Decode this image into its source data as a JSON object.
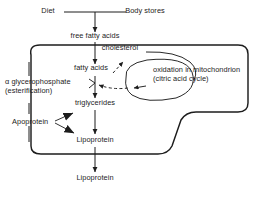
{
  "diagram": {
    "type": "flow-diagram",
    "colors": {
      "stroke": "#1d1d1d",
      "text": "#1d1d1d",
      "background": "#ffffff"
    },
    "labels": {
      "diet": "Diet",
      "body_stores": "Body stores",
      "free_fatty_acids": "free fatty acids",
      "cholesterol": "cholesterol",
      "fatty_acids": "fatty acids",
      "oxidation_line1": "oxidation in mitochondrion",
      "oxidation_line2": "(citric acid cycle)",
      "glycerophosphate_line1": "α glycerophosphate",
      "glycerophosphate_line2": "(esterification)",
      "triglycerides": "triglycerides",
      "apoprotein": "Apoprotein",
      "lipoprotein_inner": "Lipoprotein",
      "lipoprotein_outer": "Lipoprotein"
    },
    "nodes": [
      {
        "id": "diet",
        "label": "Diet",
        "x": 48,
        "y": 8
      },
      {
        "id": "body-stores",
        "label": "Body stores",
        "x": 118,
        "y": 8
      },
      {
        "id": "free-fatty-acids",
        "label": "free fatty acids",
        "x": 97,
        "y": 38
      },
      {
        "id": "cholesterol",
        "label": "cholesterol",
        "x": 114,
        "y": 50
      },
      {
        "id": "fatty-acids",
        "label": "fatty acids",
        "x": 79,
        "y": 70
      },
      {
        "id": "oxidation-mitochondrion",
        "label": "oxidation in mitochondrion (citric acid cycle)",
        "x": 155,
        "y": 73
      },
      {
        "id": "alpha-glycerophosphate",
        "label": "α glycerophosphate (esterification)",
        "x": 7,
        "y": 85
      },
      {
        "id": "triglycerides",
        "label": "triglycerides",
        "x": 75,
        "y": 103
      },
      {
        "id": "apoprotein",
        "label": "Apoprotein",
        "x": 15,
        "y": 119
      },
      {
        "id": "lipoprotein-inner",
        "label": "Lipoprotein",
        "x": 78,
        "y": 140
      },
      {
        "id": "lipoprotein-outer",
        "label": "Lipoprotein",
        "x": 78,
        "y": 178
      }
    ],
    "edges": [
      {
        "from": "diet",
        "to": "free-fatty-acids",
        "style": "solid",
        "arrow": "single"
      },
      {
        "from": "body-stores",
        "to": "free-fatty-acids",
        "style": "solid",
        "arrow": "single"
      },
      {
        "from": "free-fatty-acids",
        "to": "fatty-acids",
        "style": "solid",
        "arrow": "single"
      },
      {
        "from": "fatty-acids",
        "to": "oxidation-mitochondrion",
        "style": "dashed",
        "arrow": "single"
      },
      {
        "from": "oxidation-mitochondrion",
        "to": "fatty-acids",
        "style": "dashed",
        "arrow": "single"
      },
      {
        "from": "fatty-acids",
        "to": "triglycerides",
        "style": "solid",
        "arrow": "single"
      },
      {
        "from": "alpha-glycerophosphate",
        "to": "triglycerides",
        "style": "solid",
        "arrow": "none"
      },
      {
        "from": "apoprotein",
        "to": "triglycerides",
        "style": "solid",
        "arrow": "filled-triangle"
      },
      {
        "from": "apoprotein",
        "to": "lipoprotein-inner",
        "style": "solid",
        "arrow": "filled-triangle"
      },
      {
        "from": "triglycerides",
        "to": "lipoprotein-inner",
        "style": "solid",
        "arrow": "single"
      },
      {
        "from": "lipoprotein-inner",
        "to": "lipoprotein-outer",
        "style": "solid",
        "arrow": "single"
      }
    ],
    "shapes": [
      {
        "id": "cell-membrane",
        "kind": "rounded-irregular-outline"
      },
      {
        "id": "mitochondrion-loop",
        "kind": "closed-curve"
      }
    ]
  }
}
